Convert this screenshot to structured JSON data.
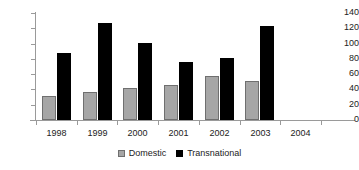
{
  "chart_data": {
    "type": "bar",
    "title": "",
    "xlabel": "",
    "ylabel": "",
    "categories": [
      "1998",
      "1999",
      "2000",
      "2001",
      "2002",
      "2003",
      "2004"
    ],
    "series": [
      {
        "name": "Domestic",
        "color": "#a6a6a6",
        "values": [
          31,
          36,
          42,
          46,
          57,
          51,
          null
        ]
      },
      {
        "name": "Transnational",
        "color": "#000000",
        "values": [
          88,
          127,
          101,
          76,
          81,
          123,
          null
        ]
      }
    ],
    "ylim": [
      0,
      140
    ],
    "yticks": [
      0,
      20,
      40,
      60,
      80,
      100,
      120,
      140
    ],
    "ytick_labels": [
      "0",
      "20",
      "40",
      "60",
      "80",
      "100",
      "120",
      "140"
    ],
    "grid": false,
    "legend_position": "bottom"
  },
  "legend": {
    "items": [
      {
        "label": "Domestic",
        "swatch": "gray-swatch-icon"
      },
      {
        "label": "Transnational",
        "swatch": "black-swatch-icon"
      }
    ]
  }
}
